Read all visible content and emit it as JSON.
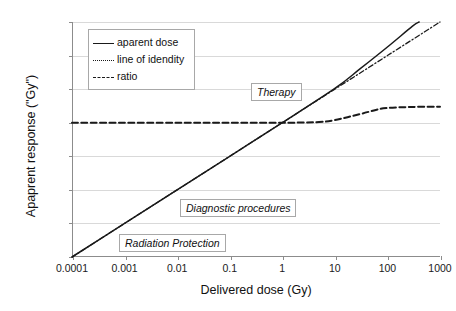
{
  "chart_data": {
    "type": "line",
    "title": "",
    "xlabel": "Delivered dose (Gy)",
    "ylabel": "Apaprent response (\"Gy\")",
    "xscale": "log",
    "yscale": "log",
    "xlim": [
      0.0001,
      1000
    ],
    "ylim": [
      0.0001,
      1000
    ],
    "grid": "horizontal",
    "legend_position": "top-left-inside",
    "xticks": [
      "0.0001",
      "0.001",
      "0.01",
      "0.1",
      "1",
      "10",
      "100",
      "1000"
    ],
    "xtick_values": [
      0.0001,
      0.001,
      0.01,
      0.1,
      1,
      10,
      100,
      1000
    ],
    "yticks": [
      "0.0001",
      "0.001",
      "0.01",
      "0.1",
      "1",
      "10",
      "100",
      "1000"
    ],
    "ytick_values": [
      0.0001,
      0.001,
      0.01,
      0.1,
      1,
      10,
      100,
      1000
    ],
    "series": [
      {
        "name": "aparent dose",
        "style": "solid",
        "color": "#1a1a1a",
        "x": [
          0.0001,
          0.001,
          0.01,
          0.1,
          1,
          10,
          30,
          100,
          300,
          400
        ],
        "y": [
          0.0001,
          0.001,
          0.01,
          0.1,
          1,
          10.5,
          40,
          180,
          750,
          1000
        ]
      },
      {
        "name": "line of idendity",
        "style": "dash-dot",
        "color": "#1a1a1a",
        "x": [
          0.0001,
          0.001,
          0.01,
          0.1,
          1,
          10,
          100,
          1000
        ],
        "y": [
          0.0001,
          0.001,
          0.01,
          0.1,
          1,
          10,
          100,
          1000
        ]
      },
      {
        "name": "ratio",
        "style": "dashed",
        "color": "#1a1a1a",
        "x": [
          0.0001,
          0.01,
          1,
          5,
          10,
          30,
          60,
          100,
          300,
          1000
        ],
        "y": [
          1,
          1,
          1,
          1.05,
          1.2,
          1.8,
          2.4,
          2.75,
          2.95,
          3.0
        ]
      }
    ],
    "annotations": [
      {
        "text": "Therapy",
        "x": 18,
        "y": 9
      },
      {
        "text": "Diagnostic procedures",
        "x": 0.6,
        "y": 0.0045
      },
      {
        "text": "Radiation Protection",
        "x": 0.02,
        "y": 0.00055
      }
    ]
  },
  "legend": {
    "items": [
      {
        "label": "aparent dose",
        "style": "solid"
      },
      {
        "label": "line of idendity",
        "style": "dash-dot"
      },
      {
        "label": "ratio",
        "style": "dashed"
      }
    ]
  },
  "axes": {
    "x_title": "Delivered dose (Gy)",
    "y_title": "Apaprent response (\"Gy\")"
  },
  "colors": {
    "line": "#1a1a1a",
    "grid": "#d9d9d9",
    "axis": "#8c8c8c",
    "box_border": "#a8a8a8",
    "background": "#ffffff"
  }
}
